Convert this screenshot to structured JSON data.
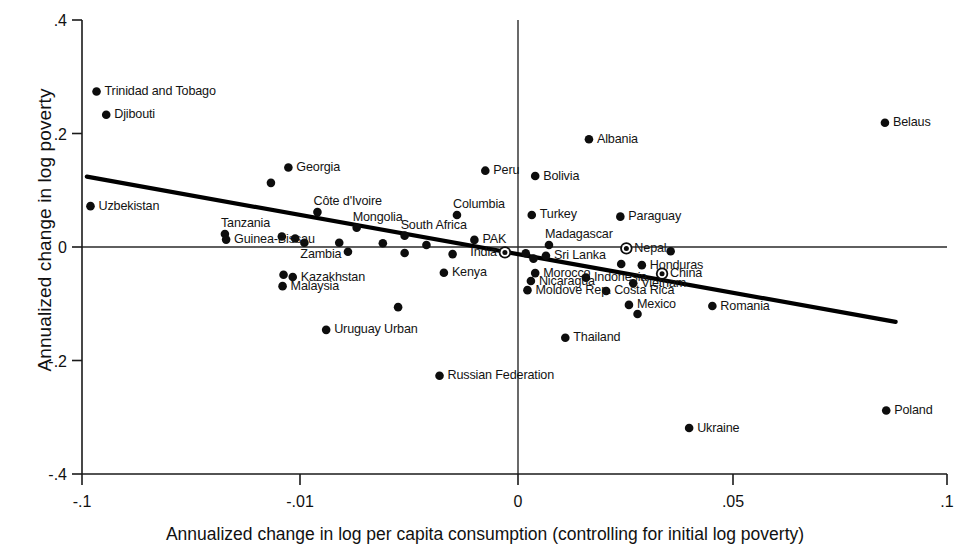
{
  "chart_data": {
    "type": "scatter",
    "title": "",
    "xlabel": "Annualized change in log per capita consumption (controlling for initial log poverty)",
    "ylabel": "Annualized change in log poverty",
    "xlim": [
      -0.1,
      0.1
    ],
    "ylim": [
      -0.4,
      0.4
    ],
    "xticks": [
      -0.1,
      -0.01,
      0,
      0.05,
      0.1
    ],
    "xticklabels": [
      "-.1",
      "-.01",
      "0",
      ".05",
      ".1"
    ],
    "yticks": [
      0.4,
      0.2,
      0,
      -0.2,
      -0.4
    ],
    "yticklabels": [
      ".4",
      ".2",
      "0",
      "-.2",
      "-.4"
    ],
    "grid": false,
    "legend": null,
    "reference_lines": [
      {
        "name": "zero-horizontal",
        "orientation": "horizontal",
        "value": 0
      },
      {
        "name": "zero-vertical",
        "orientation": "vertical",
        "value": 0
      }
    ],
    "fit_line": {
      "name": "regression-line",
      "x_start": -0.098,
      "y_start": 0.124,
      "x_end": 0.088,
      "y_end": -0.132
    },
    "points": [
      {
        "label": "Trinidad and Tobago",
        "x": -0.094,
        "y": 0.274,
        "marker": "filled",
        "label_pos": "right"
      },
      {
        "label": "Djibouti",
        "x": -0.09,
        "y": 0.233,
        "marker": "filled",
        "label_pos": "right"
      },
      {
        "label": "Belaus",
        "x": 0.0855,
        "y": 0.219,
        "marker": "filled",
        "label_pos": "right"
      },
      {
        "label": "Albania",
        "x": 0.0165,
        "y": 0.19,
        "marker": "filled",
        "label_pos": "right"
      },
      {
        "label": "Peru",
        "x": -0.0015,
        "y": 0.1345,
        "marker": "filled",
        "label_pos": "right"
      },
      {
        "label": "Bolivia",
        "x": 0.004,
        "y": 0.125,
        "marker": "filled",
        "label_pos": "right"
      },
      {
        "label": "Georgia",
        "x": -0.0148,
        "y": 0.14,
        "marker": "filled",
        "label_pos": "right"
      },
      {
        "label": "",
        "x": -0.022,
        "y": 0.113,
        "marker": "filled",
        "label_pos": "none"
      },
      {
        "label": "Uzbekistan",
        "x": -0.0965,
        "y": 0.072,
        "marker": "filled",
        "label_pos": "right"
      },
      {
        "label": "Côte d'Ivoire",
        "x": -0.0092,
        "y": 0.0615,
        "marker": "filled",
        "label_pos": "above"
      },
      {
        "label": "Columbia",
        "x": -0.0028,
        "y": 0.0565,
        "marker": "filled",
        "label_pos": "above"
      },
      {
        "label": "Turkey",
        "x": 0.0032,
        "y": 0.0565,
        "marker": "filled",
        "label_pos": "right"
      },
      {
        "label": "Paraguay",
        "x": 0.0238,
        "y": 0.0535,
        "marker": "filled",
        "label_pos": "right"
      },
      {
        "label": "Mongolia",
        "x": -0.0074,
        "y": 0.034,
        "marker": "filled",
        "label_pos": "above"
      },
      {
        "label": "South Africa",
        "x": -0.0052,
        "y": 0.02,
        "marker": "filled",
        "label_pos": "above"
      },
      {
        "label": "PAK",
        "x": -0.002,
        "y": 0.0125,
        "marker": "filled",
        "label_pos": "right"
      },
      {
        "label": "Tanzania",
        "x": -0.041,
        "y": 0.023,
        "marker": "filled",
        "label_pos": "above"
      },
      {
        "label": "Guinea-Bissau",
        "x": -0.0405,
        "y": 0.013,
        "marker": "filled",
        "label_pos": "right"
      },
      {
        "label": "",
        "x": -0.0175,
        "y": 0.0185,
        "marker": "filled",
        "label_pos": "none"
      },
      {
        "label": "",
        "x": -0.012,
        "y": 0.015,
        "marker": "filled",
        "label_pos": "none"
      },
      {
        "label": "Zambia",
        "x": -0.0098,
        "y": 0.0075,
        "marker": "filled",
        "label_pos": "below"
      },
      {
        "label": "",
        "x": -0.0082,
        "y": 0.0075,
        "marker": "filled",
        "label_pos": "none"
      },
      {
        "label": "",
        "x": -0.0062,
        "y": 0.0065,
        "marker": "filled",
        "label_pos": "none"
      },
      {
        "label": "",
        "x": -0.0042,
        "y": 0.0035,
        "marker": "filled",
        "label_pos": "none"
      },
      {
        "label": "Madagascar",
        "x": 0.0072,
        "y": 0.0035,
        "marker": "filled",
        "label_pos": "above"
      },
      {
        "label": "Nepal",
        "x": 0.0252,
        "y": -0.0025,
        "marker": "ringed",
        "label_pos": "right"
      },
      {
        "label": "India",
        "x": -0.0006,
        "y": -0.0095,
        "marker": "ringed",
        "label_pos": "left"
      },
      {
        "label": "Sri Lanka",
        "x": 0.0065,
        "y": -0.0155,
        "marker": "filled",
        "label_pos": "right"
      },
      {
        "label": "",
        "x": 0.0018,
        "y": -0.011,
        "marker": "filled",
        "label_pos": "none"
      },
      {
        "label": "",
        "x": -0.003,
        "y": -0.0125,
        "marker": "filled",
        "label_pos": "none"
      },
      {
        "label": "",
        "x": -0.0052,
        "y": -0.0105,
        "marker": "filled",
        "label_pos": "none"
      },
      {
        "label": "",
        "x": -0.0078,
        "y": -0.0085,
        "marker": "filled",
        "label_pos": "none"
      },
      {
        "label": "",
        "x": 0.0036,
        "y": -0.0205,
        "marker": "filled",
        "label_pos": "none"
      },
      {
        "label": "",
        "x": 0.0355,
        "y": -0.0075,
        "marker": "filled",
        "label_pos": "none"
      },
      {
        "label": "",
        "x": 0.024,
        "y": -0.03,
        "marker": "filled",
        "label_pos": "none"
      },
      {
        "label": "Honduras",
        "x": 0.0288,
        "y": -0.032,
        "marker": "filled",
        "label_pos": "right"
      },
      {
        "label": "China",
        "x": 0.0335,
        "y": -0.047,
        "marker": "ringed",
        "label_pos": "right"
      },
      {
        "label": "Kenya",
        "x": -0.0034,
        "y": -0.0455,
        "marker": "filled",
        "label_pos": "right"
      },
      {
        "label": "Morocco",
        "x": 0.004,
        "y": -0.046,
        "marker": "filled",
        "label_pos": "right"
      },
      {
        "label": "Indonesia",
        "x": 0.0158,
        "y": -0.054,
        "marker": "filled",
        "label_pos": "right"
      },
      {
        "label": "Nicaragua",
        "x": 0.003,
        "y": -0.06,
        "marker": "filled",
        "label_pos": "right"
      },
      {
        "label": "Vietnam",
        "x": 0.0268,
        "y": -0.064,
        "marker": "filled",
        "label_pos": "right"
      },
      {
        "label": "Kazakhstan",
        "x": -0.013,
        "y": -0.053,
        "marker": "filled",
        "label_pos": "right"
      },
      {
        "label": "",
        "x": -0.0168,
        "y": -0.049,
        "marker": "filled",
        "label_pos": "none"
      },
      {
        "label": "Malaysia",
        "x": -0.0172,
        "y": -0.069,
        "marker": "filled",
        "label_pos": "right"
      },
      {
        "label": "Moldove Rep.",
        "x": 0.0022,
        "y": -0.076,
        "marker": "filled",
        "label_pos": "right"
      },
      {
        "label": "Costa Rica",
        "x": 0.0205,
        "y": -0.0775,
        "marker": "filled",
        "label_pos": "right"
      },
      {
        "label": "Mexico",
        "x": 0.0258,
        "y": -0.102,
        "marker": "filled",
        "label_pos": "right"
      },
      {
        "label": "",
        "x": 0.0278,
        "y": -0.118,
        "marker": "filled",
        "label_pos": "none"
      },
      {
        "label": "Romania",
        "x": 0.0452,
        "y": -0.104,
        "marker": "filled",
        "label_pos": "right"
      },
      {
        "label": "",
        "x": -0.0055,
        "y": -0.106,
        "marker": "filled",
        "label_pos": "none"
      },
      {
        "label": "Uruguay Urban",
        "x": -0.0088,
        "y": -0.146,
        "marker": "filled",
        "label_pos": "right"
      },
      {
        "label": "Thailand",
        "x": 0.011,
        "y": -0.16,
        "marker": "filled",
        "label_pos": "right"
      },
      {
        "label": "Russian Federation",
        "x": -0.0036,
        "y": -0.227,
        "marker": "filled",
        "label_pos": "right"
      },
      {
        "label": "Ukraine",
        "x": 0.0398,
        "y": -0.319,
        "marker": "filled",
        "label_pos": "right"
      },
      {
        "label": "Poland",
        "x": 0.0858,
        "y": -0.288,
        "marker": "filled",
        "label_pos": "right"
      }
    ]
  }
}
